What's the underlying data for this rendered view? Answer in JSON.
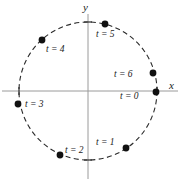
{
  "figure": {
    "background_color": "#ffffff",
    "axis_color": "#9a9a9a",
    "curve_color": "#2b2b2b",
    "point_color": "#111111",
    "text_color": "#1a1a1a"
  },
  "axes": {
    "x_label": "x",
    "y_label": "y",
    "origin": {
      "x": 88,
      "y": 91
    }
  },
  "chart_data": {
    "type": "scatter",
    "title": "",
    "subtitle": "",
    "xlabel": "x",
    "ylabel": "y",
    "xlim": [
      -1.28,
      1.46
    ],
    "ylim": [
      -1.3,
      1.3
    ],
    "grid": false,
    "legend": "none",
    "curve": {
      "name": "unit circle",
      "style": "dashed",
      "center": [
        0,
        0
      ],
      "radius": 1
    },
    "annotations": [
      "Points are labeled by parameter t and advance clockwise around the circle."
    ],
    "series": [
      {
        "name": "position at time t",
        "points": [
          {
            "label": "t = 0",
            "t": 0,
            "angle_deg": 0,
            "x": 1.0,
            "y": 0.0,
            "px": 156,
            "py": 92,
            "label_px": 120,
            "label_py": 99,
            "anchor": "start"
          },
          {
            "label": "t = 1",
            "t": 1,
            "angle_deg": -57,
            "x": 0.545,
            "y": -0.839,
            "px": 126,
            "py": 148,
            "label_px": 96,
            "label_py": 145,
            "anchor": "start"
          },
          {
            "label": "t = 2",
            "t": 2,
            "angle_deg": -113,
            "x": -0.391,
            "y": -0.92,
            "px": 60,
            "py": 155,
            "label_px": 65,
            "label_py": 153,
            "anchor": "start"
          },
          {
            "label": "t = 3",
            "t": 3,
            "angle_deg": -169,
            "x": -0.982,
            "y": -0.191,
            "px": 18,
            "py": 104,
            "label_px": 25,
            "label_py": 107,
            "anchor": "start"
          },
          {
            "label": "t = 4",
            "t": 4,
            "angle_deg": 132,
            "x": -0.669,
            "y": 0.743,
            "px": 42,
            "py": 40,
            "label_px": 46,
            "label_py": 52,
            "anchor": "start"
          },
          {
            "label": "t = 5",
            "t": 5,
            "angle_deg": 76,
            "x": 0.242,
            "y": 0.97,
            "px": 105,
            "py": 24,
            "label_px": 96,
            "label_py": 37,
            "anchor": "start"
          },
          {
            "label": "t = 6",
            "t": 6,
            "angle_deg": 15,
            "x": 0.966,
            "y": 0.259,
            "px": 153,
            "py": 73,
            "label_px": 114,
            "label_py": 77,
            "anchor": "start"
          }
        ]
      }
    ]
  }
}
